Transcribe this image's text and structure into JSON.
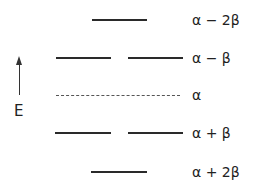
{
  "diagram": {
    "type": "energy-level-diagram",
    "axis": {
      "label": "E",
      "direction": "up"
    },
    "levels": [
      {
        "label": "α − 2β",
        "degeneracy": 1,
        "style": "solid"
      },
      {
        "label": "α − β",
        "degeneracy": 2,
        "style": "solid"
      },
      {
        "label": "α",
        "degeneracy": 0,
        "style": "dashed"
      },
      {
        "label": "α + β",
        "degeneracy": 2,
        "style": "solid"
      },
      {
        "label": "α + 2β",
        "degeneracy": 1,
        "style": "solid"
      }
    ]
  }
}
